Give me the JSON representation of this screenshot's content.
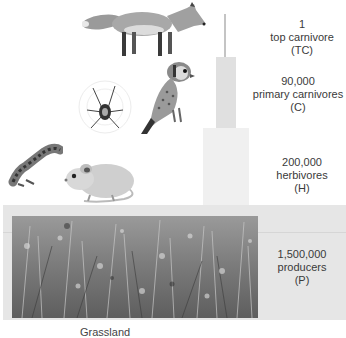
{
  "diagram": {
    "type": "pyramid of numbers",
    "levels": [
      {
        "count": "1",
        "name": "top carnivore",
        "abbr": "(TC)",
        "organism": "fox"
      },
      {
        "count": "90,000",
        "name": "primary carnivores",
        "abbr": "(C)",
        "organism": "kestrel and spider"
      },
      {
        "count": "200,000",
        "name": "herbivores",
        "abbr": "(H)",
        "organism": "mouse and caterpillar"
      },
      {
        "count": "1,500,000",
        "name": "producers",
        "abbr": "(P)",
        "organism": "grassland plants"
      }
    ],
    "caption": "Grassland"
  },
  "colors": {
    "tc_bar": "#c4c4c4",
    "c_bar": "#e0e0e0",
    "h_bar": "#f0f0f0",
    "p_band": "#e6e6e6"
  }
}
